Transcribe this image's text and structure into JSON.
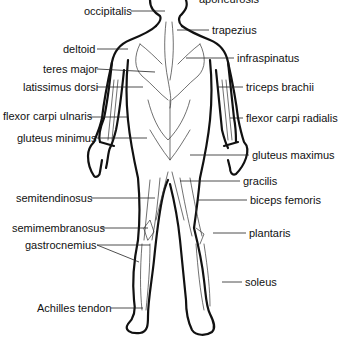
{
  "diagram": {
    "labels_left": [
      {
        "id": "occipitalis",
        "text": "occipitalis",
        "x": 84,
        "y": 5,
        "lx1": 131,
        "ly": 11,
        "lx2": 165
      },
      {
        "id": "deltoid",
        "text": "deltoid",
        "x": 63,
        "y": 43,
        "lx1": 97,
        "ly": 49,
        "lx2": 128
      },
      {
        "id": "teres-major",
        "text": "teres major",
        "x": 43,
        "y": 63,
        "lx1": 97,
        "ly": 69,
        "lx2": 155
      },
      {
        "id": "latissimus-dorsi",
        "text": "latissimus dorsi",
        "x": 23,
        "y": 81,
        "lx1": 97,
        "ly": 87,
        "lx2": 143
      },
      {
        "id": "flexor-carpi-ulnaris",
        "text": "flexor carpi ulnaris",
        "x": 3,
        "y": 110,
        "lx1": 89,
        "ly": 117,
        "lx2": 127
      },
      {
        "id": "gluteus-minimus",
        "text": "gluteus minimus",
        "x": 17,
        "y": 132,
        "lx1": 97,
        "ly": 138,
        "lx2": 147
      },
      {
        "id": "semitendinosus",
        "text": "semitendinosus",
        "x": 16,
        "y": 192,
        "lx1": 91,
        "ly": 198,
        "lx2": 155
      },
      {
        "id": "semimembranosus",
        "text": "semimembranosus",
        "x": 12,
        "y": 222,
        "lx1": 101,
        "ly": 228,
        "lx2": 148
      },
      {
        "id": "gastrocnemius",
        "text": "gastrocnemius",
        "x": 25,
        "y": 239,
        "lx1": 97,
        "ly": 245,
        "lx2": 150
      },
      {
        "id": "achilles-tendon",
        "text": "Achilles tendon",
        "x": 37,
        "y": 302,
        "lx1": 111,
        "ly": 308,
        "lx2": 143
      }
    ],
    "labels_right": [
      {
        "id": "aponeurosis",
        "text": "aponeurosis",
        "x": 199,
        "y": -7,
        "lx1": 0,
        "ly": 0,
        "lx2": 0
      },
      {
        "id": "trapezius",
        "text": "trapezius",
        "x": 212,
        "y": 24,
        "lx1": 177,
        "ly": 30,
        "lx2": 209
      },
      {
        "id": "infraspinatus",
        "text": "infraspinatus",
        "x": 237,
        "y": 52,
        "lx1": 186,
        "ly": 58,
        "lx2": 234
      },
      {
        "id": "triceps-brachii",
        "text": "triceps brachii",
        "x": 246,
        "y": 81,
        "lx1": 218,
        "ly": 87,
        "lx2": 243
      },
      {
        "id": "flexor-carpi-radialis",
        "text": "flexor carpi radialis",
        "x": 246,
        "y": 112,
        "lx1": 230,
        "ly": 118,
        "lx2": 243
      },
      {
        "id": "gluteus-maximus",
        "text": "gluteus maximus",
        "x": 252,
        "y": 149,
        "lx1": 190,
        "ly": 155,
        "lx2": 249
      },
      {
        "id": "gracilis",
        "text": "gracilis",
        "x": 243,
        "y": 175,
        "lx1": 180,
        "ly": 181,
        "lx2": 240
      },
      {
        "id": "biceps-femoris",
        "text": "biceps femoris",
        "x": 250,
        "y": 194,
        "lx1": 197,
        "ly": 200,
        "lx2": 247
      },
      {
        "id": "plantaris",
        "text": "plantaris",
        "x": 249,
        "y": 227,
        "lx1": 213,
        "ly": 233,
        "lx2": 246
      },
      {
        "id": "soleus",
        "text": "soleus",
        "x": 245,
        "y": 276,
        "lx1": 222,
        "ly": 282,
        "lx2": 242
      }
    ],
    "colors": {
      "background": "#ffffff",
      "outline": "#111111",
      "text": "#111111"
    }
  }
}
